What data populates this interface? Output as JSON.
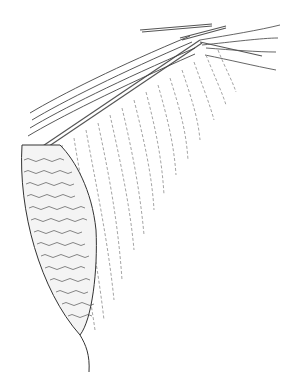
{
  "illustration": {
    "subject": "knitting in progress on needles with dropped stitch ladders and knitted panel",
    "background_color": "#ffffff",
    "ink_color": "#333333",
    "light_ink_color": "#8a8a8a"
  }
}
